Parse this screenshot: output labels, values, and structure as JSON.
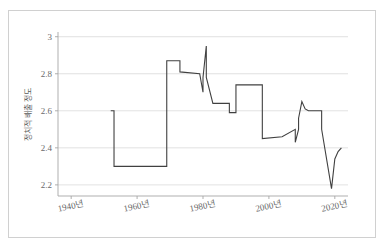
{
  "chart_data": {
    "type": "line",
    "title": "",
    "xlabel": "",
    "ylabel": "정치적 배출 정도",
    "xlim": [
      1936,
      2024
    ],
    "ylim": [
      2.14,
      3.02
    ],
    "grid": true,
    "legend": false,
    "x_ticks": [
      1940,
      1960,
      1980,
      2000,
      2020
    ],
    "x_tick_labels": [
      "1940년",
      "1960년",
      "1980년",
      "2000년",
      "2020년"
    ],
    "y_ticks": [
      2.2,
      2.4,
      2.6,
      2.8,
      3
    ],
    "y_tick_labels": [
      "2.2",
      "2.4",
      "2.6",
      "2.8",
      "3"
    ],
    "series": [
      {
        "name": "정치적 배출 정도",
        "color": "#404040",
        "x": [
          1952,
          1953,
          1953,
          1969,
          1969,
          1973,
          1973,
          1979,
          1980,
          1980,
          1981,
          1981,
          1983,
          1984,
          1984,
          1988,
          1988,
          1990,
          1990,
          1992,
          1992,
          1998,
          1998,
          2004,
          2004,
          2008,
          2008,
          2009,
          2009,
          2010,
          2011,
          2012,
          2012,
          2016,
          2016,
          2019,
          2020,
          2021,
          2022
        ],
        "y": [
          2.6,
          2.6,
          2.3,
          2.3,
          2.87,
          2.87,
          2.81,
          2.8,
          2.7,
          2.78,
          2.95,
          2.78,
          2.64,
          2.64,
          2.64,
          2.64,
          2.59,
          2.59,
          2.74,
          2.74,
          2.74,
          2.74,
          2.45,
          2.46,
          2.46,
          2.5,
          2.43,
          2.5,
          2.56,
          2.65,
          2.61,
          2.6,
          2.6,
          2.6,
          2.5,
          2.18,
          2.34,
          2.38,
          2.4
        ]
      }
    ]
  },
  "plot_geometry": {
    "left": 58,
    "right": 348,
    "top": 33,
    "bottom": 196
  }
}
